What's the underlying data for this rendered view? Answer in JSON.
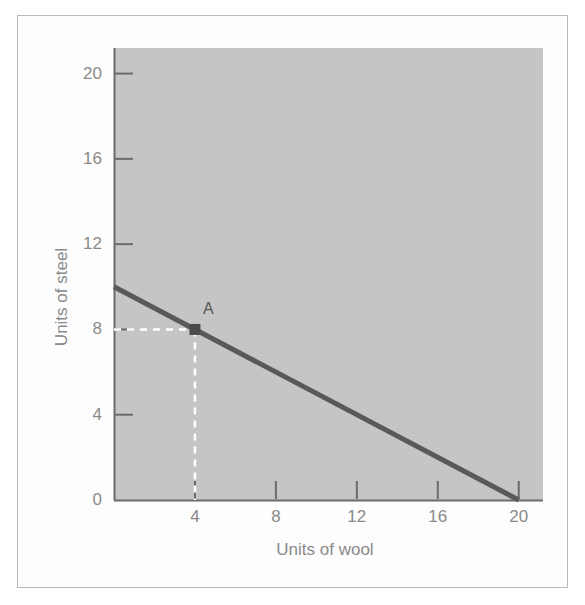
{
  "figure": {
    "background_color": "#ffffff",
    "frame_color": "#b9b9b9",
    "plot_background_color": "#c5c5c5",
    "axis_color": "#6b6b6b",
    "line_color": "#595959",
    "guide_color": "#ffffff",
    "text_color": "#8a8a8a"
  },
  "chart_data": {
    "type": "line",
    "title": "",
    "subtitle": "",
    "xlabel": "Units of wool",
    "ylabel": "Units of steel",
    "xlim": [
      0,
      21.2
    ],
    "ylim": [
      0,
      21.2
    ],
    "xticks": [
      4,
      8,
      12,
      16,
      20
    ],
    "xtick_labels": [
      "4",
      "8",
      "12",
      "16",
      "20"
    ],
    "yticks": [
      0,
      4,
      8,
      12,
      16,
      20
    ],
    "ytick_labels": [
      "0",
      "4",
      "8",
      "12",
      "16",
      "20"
    ],
    "grid": false,
    "legend": null,
    "legend_position": "none",
    "series": [
      {
        "name": "Budget line",
        "type": "line",
        "x": [
          0,
          20
        ],
        "y": [
          10,
          0
        ],
        "slope": -0.5,
        "x_intercept": 20,
        "y_intercept": 10,
        "color": "#595959",
        "width": 5
      }
    ],
    "annotations": [
      {
        "label": "A",
        "x": 4,
        "y": 8,
        "marker": "square",
        "marker_color": "#4c4c4c",
        "guides": [
          {
            "from": [
              0,
              8
            ],
            "to": [
              4,
              8
            ],
            "style": "dashed",
            "color": "#ffffff"
          },
          {
            "from": [
              4,
              8
            ],
            "to": [
              4,
              0
            ],
            "style": "dashed",
            "color": "#ffffff"
          }
        ]
      }
    ]
  }
}
